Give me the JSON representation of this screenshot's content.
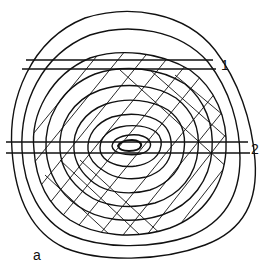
{
  "diagram": {
    "type": "tree-ring cross-section",
    "labels": {
      "band_1": "1",
      "band_2": "2",
      "corner": "a"
    },
    "ring_count": 10,
    "cut_bands": [
      {
        "label": "1",
        "y_top": 60,
        "y_bottom": 69
      },
      {
        "label": "2",
        "y_top": 142,
        "y_bottom": 153
      }
    ],
    "colors": {
      "line": "#111111",
      "background": "#ffffff"
    }
  }
}
